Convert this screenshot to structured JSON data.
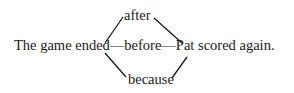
{
  "diagram": {
    "sentence": {
      "left_clause": "The game ended",
      "dash1": "—",
      "connective": "before",
      "dash2": "—",
      "right_clause": "Pat scored again."
    },
    "alternatives": {
      "top": "after",
      "bottom": "because"
    },
    "line_color": "#1a1a1a"
  }
}
